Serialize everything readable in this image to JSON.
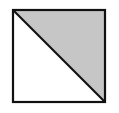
{
  "diagram": {
    "shape": "square-divided-by-diagonal",
    "square": {
      "x": 13,
      "y": 10,
      "width": 92,
      "height": 92,
      "stroke": "#111111"
    },
    "diagonal": {
      "from": "top-left",
      "to": "bottom-right"
    },
    "shaded_region": {
      "name": "upper-right-triangle",
      "fill": "#c6c6c6"
    },
    "unshaded_region": {
      "name": "lower-left-triangle",
      "fill": "#ffffff"
    },
    "shaded_fraction": "1/2"
  }
}
